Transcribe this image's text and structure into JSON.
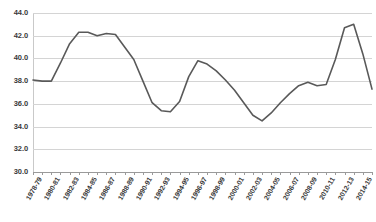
{
  "chart_data": {
    "type": "line",
    "title": "",
    "subtitle": "",
    "xlabel": "",
    "ylabel": "",
    "ylim": [
      30.0,
      44.0
    ],
    "ytick_step": 2.0,
    "ytick_labels": [
      "44.0",
      "42.0",
      "40.0",
      "38.0",
      "36.0",
      "34.0",
      "32.0",
      "30.0"
    ],
    "ytick_values": [
      44.0,
      42.0,
      40.0,
      38.0,
      36.0,
      34.0,
      32.0,
      30.0
    ],
    "grid": true,
    "legend": "none",
    "line_color": "#595959",
    "x_label_interval": 2,
    "xtick_labels": [
      "1978-79",
      "1980-81",
      "1982-83",
      "1984-85",
      "1986-87",
      "1988-89",
      "1990-91",
      "1992-93",
      "1994-95",
      "1996-97",
      "1998-99",
      "2000-01",
      "2002-03",
      "2004-05",
      "2006-07",
      "2008-09",
      "2010-11",
      "2012-13",
      "2014-15"
    ],
    "categories": [
      "1978-79",
      "1979-80",
      "1980-81",
      "1981-82",
      "1982-83",
      "1983-84",
      "1984-85",
      "1985-86",
      "1986-87",
      "1987-88",
      "1988-89",
      "1989-90",
      "1990-91",
      "1991-92",
      "1992-93",
      "1993-94",
      "1994-95",
      "1995-96",
      "1996-97",
      "1997-98",
      "1998-99",
      "1999-00",
      "2000-01",
      "2001-02",
      "2002-03",
      "2003-04",
      "2004-05",
      "2005-06",
      "2006-07",
      "2007-08",
      "2008-09",
      "2009-10",
      "2010-11",
      "2011-12",
      "2012-13",
      "2013-14",
      "2014-15",
      "2015-16"
    ],
    "values": [
      38.1,
      38.0,
      38.0,
      39.6,
      41.3,
      42.3,
      42.3,
      42.0,
      42.2,
      42.1,
      41.0,
      39.9,
      38.0,
      36.1,
      35.4,
      35.3,
      36.2,
      38.4,
      39.8,
      39.5,
      38.9,
      38.1,
      37.2,
      36.1,
      35.0,
      34.5,
      35.2,
      36.1,
      36.9,
      37.6,
      37.9,
      37.6,
      37.7,
      39.9,
      42.7,
      43.0,
      40.4,
      37.3
    ]
  }
}
